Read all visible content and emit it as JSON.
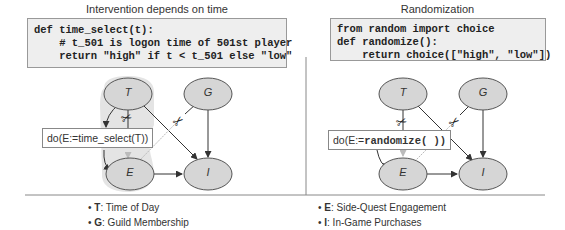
{
  "left_panel": {
    "title": "Intervention depends on time",
    "code_lines": [
      "def time_select(t):",
      "    # t_501 is logon time of 501st player",
      "    return \"high\" if t < t_501 else \"low\""
    ],
    "intervention_label_prefix": "do(E:=",
    "intervention_label_func": "time_select(T))",
    "nodes": {
      "T": "T",
      "G": "G",
      "E": "E",
      "I": "I"
    }
  },
  "right_panel": {
    "title": "Randomization",
    "code_lines": [
      "from random import choice",
      "def randomize():",
      "    return choice([\"high\", \"low\"])"
    ],
    "intervention_label_prefix": "do(E:=",
    "intervention_label_func": "randomize( ))",
    "nodes": {
      "T": "T",
      "G": "G",
      "E": "E",
      "I": "I"
    }
  },
  "legend": {
    "left": [
      {
        "key": "T",
        "label": ": Time of Day"
      },
      {
        "key": "G",
        "label": ": Guild Membership"
      }
    ],
    "right": [
      {
        "key": "E",
        "label": ": Side-Quest Engagement"
      },
      {
        "key": "I",
        "label": ": In-Game Purchases"
      }
    ]
  },
  "colors": {
    "node_fill": "#d6d6d6",
    "node_stroke": "#555555",
    "highlight": "#e2e2e2",
    "code_bg": "#eeeeee",
    "edge": "#444444",
    "cut_edge": "#bbbbbb"
  },
  "icons": {
    "cut": "scissors-icon"
  }
}
